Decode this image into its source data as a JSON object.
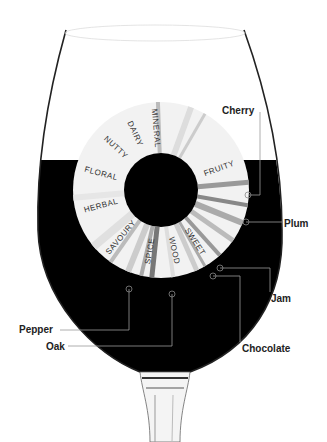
{
  "diagram": {
    "wheel_categories": [
      {
        "label": "MINERAL",
        "angle": -95
      },
      {
        "label": "DAIRY",
        "angle": -115
      },
      {
        "label": "NUTTY",
        "angle": -137
      },
      {
        "label": "FLORAL",
        "angle": -165
      },
      {
        "label": "HERBAL",
        "angle": 165
      },
      {
        "label": "SAVOURY",
        "angle": 130
      },
      {
        "label": "SPICE",
        "angle": 100
      },
      {
        "label": "WOOD",
        "angle": 78
      },
      {
        "label": "SWEET",
        "angle": 57
      },
      {
        "label": "FRUITY",
        "angle": -20
      }
    ],
    "callouts": [
      {
        "label": "Cherry",
        "x": 222,
        "y": 112
      },
      {
        "label": "Plum",
        "x": 284,
        "y": 226
      },
      {
        "label": "Jam",
        "x": 271,
        "y": 301
      },
      {
        "label": "Chocolate",
        "x": 242,
        "y": 351
      },
      {
        "label": "Pepper",
        "x": 19,
        "y": 332
      },
      {
        "label": "Oak",
        "x": 46,
        "y": 349
      }
    ],
    "colors": {
      "wine": "#000000",
      "wheel": "#f2f2f2",
      "glass_outline": "#222222",
      "callout_line": "#888888"
    }
  }
}
